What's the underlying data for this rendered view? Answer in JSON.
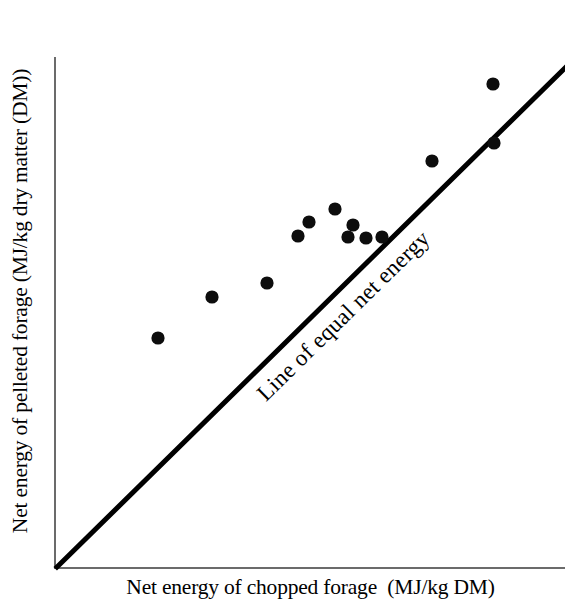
{
  "figure": {
    "background_color": "#ffffff",
    "axis_color": "#6b6b6b",
    "line_color": "#000000",
    "point_color": "#0d0d0d"
  },
  "annotations": {
    "equality_line_label": "Line of equal net energy"
  },
  "chart_data": {
    "type": "scatter",
    "title": "",
    "xlabel": "Net energy of chopped forage  (MJ/kg DM)",
    "ylabel": "Net energy of pelleted forage (MJ/kg dry matter (DM))",
    "xlim": [
      0,
      1
    ],
    "ylim": [
      0,
      1
    ],
    "grid": false,
    "legend": "none",
    "tick_labels": {
      "x": [],
      "y": []
    },
    "reference_line": {
      "label": "Line of equal net energy",
      "description": "1:1 line of equality drawn from the origin to the upper right corner",
      "slope": 1,
      "intercept": 0
    },
    "series": [
      {
        "name": "Forage samples",
        "marker": "filled-circle",
        "points": [
          {
            "px": 158,
            "py": 338,
            "x": 0.2,
            "y": 0.45
          },
          {
            "px": 212,
            "py": 297,
            "x": 0.306,
            "y": 0.53
          },
          {
            "px": 267,
            "py": 283,
            "x": 0.415,
            "y": 0.558
          },
          {
            "px": 298,
            "py": 236,
            "x": 0.475,
            "y": 0.65
          },
          {
            "px": 309,
            "py": 222,
            "x": 0.497,
            "y": 0.677
          },
          {
            "px": 335,
            "py": 209,
            "x": 0.548,
            "y": 0.702
          },
          {
            "px": 348,
            "py": 237,
            "x": 0.574,
            "y": 0.648
          },
          {
            "px": 353,
            "py": 225,
            "x": 0.583,
            "y": 0.671
          },
          {
            "px": 366,
            "py": 238,
            "x": 0.609,
            "y": 0.646
          },
          {
            "px": 382,
            "py": 237,
            "x": 0.64,
            "y": 0.648
          },
          {
            "px": 432,
            "py": 161,
            "x": 0.739,
            "y": 0.796
          },
          {
            "px": 494,
            "py": 143,
            "x": 0.86,
            "y": 0.831
          },
          {
            "px": 493,
            "py": 84,
            "x": 0.859,
            "y": 0.947
          }
        ]
      }
    ]
  }
}
